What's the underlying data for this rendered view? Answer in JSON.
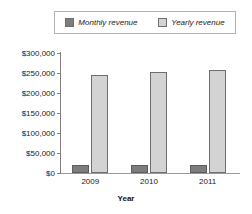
{
  "chart_data": {
    "type": "bar",
    "title": "",
    "xlabel": "Year",
    "ylabel": "",
    "categories": [
      "2009",
      "2010",
      "2011"
    ],
    "series": [
      {
        "name": "Monthly revenue",
        "values": [
          21000,
          20000,
          19000
        ],
        "color": "#7d7d7d"
      },
      {
        "name": "Yearly revenue",
        "values": [
          246000,
          252000,
          258000
        ],
        "color": "#d3d3d3"
      }
    ],
    "ylim": [
      0,
      300000
    ],
    "ytick_values": [
      300000,
      250000,
      200000,
      150000,
      100000,
      50000,
      0
    ],
    "ytick_labels": [
      "$300,000",
      "$250,000",
      "$200,000",
      "$150,000",
      "$100,000",
      "$50,000",
      "$0"
    ],
    "grid": false,
    "legend_position": "top"
  },
  "legend": {
    "entries": [
      {
        "label": "Monthly revenue",
        "swatch": "monthly-swatch"
      },
      {
        "label": "Yearly revenue",
        "swatch": "yearly-swatch"
      }
    ]
  },
  "axes": {
    "x_title": "Year",
    "x_labels": [
      "2009",
      "2010",
      "2011"
    ],
    "y_labels": [
      "$300,000",
      "$250,000",
      "$200,000",
      "$150,000",
      "$100,000",
      "$50,000",
      "$0"
    ]
  }
}
